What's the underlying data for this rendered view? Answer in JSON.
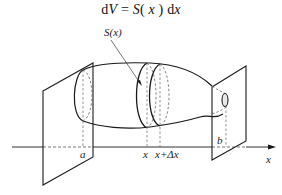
{
  "formula": {
    "lhs_d": "d",
    "lhs_var": "V",
    "eq": " = ",
    "func": "S",
    "arg_open": "( ",
    "arg": "x",
    "arg_close": " )",
    "rhs_d": " d",
    "rhs_var": "x"
  },
  "labels": {
    "area": "S(x)",
    "a": "a",
    "b": "b",
    "x": "x",
    "x_plus_dx": "x+Δx",
    "axis": "x"
  },
  "colors": {
    "stroke": "#1a1a1a",
    "dashed": "#666666",
    "background": "#ffffff"
  }
}
